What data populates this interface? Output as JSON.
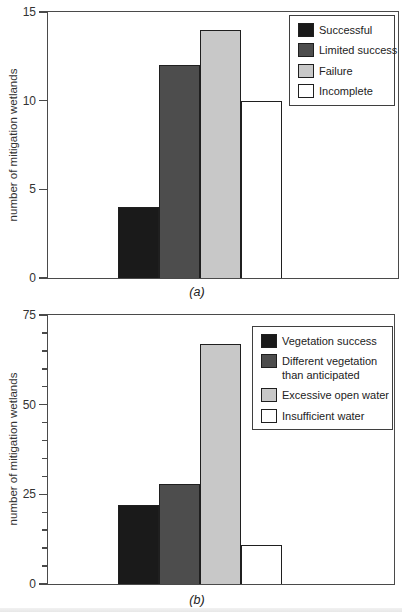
{
  "chart_data": [
    {
      "type": "bar",
      "panel": "(a)",
      "ylabel": "number of mitigation wetlands",
      "xlabel": "",
      "title": "",
      "ylim": [
        0,
        15
      ],
      "yticks": [
        0,
        5,
        10,
        15
      ],
      "minor_tick_step": null,
      "grid": false,
      "legend_position": "top-right",
      "categories": [
        "Successful",
        "Limited success",
        "Failure",
        "Incomplete"
      ],
      "values": [
        4,
        12,
        14,
        10
      ],
      "colors": [
        "#1a1a1a",
        "#4d4d4d",
        "#c8c8c8",
        "#ffffff"
      ]
    },
    {
      "type": "bar",
      "panel": "(b)",
      "ylabel": "number of mitigation wetlands",
      "xlabel": "",
      "title": "",
      "ylim": [
        0,
        75
      ],
      "yticks": [
        0,
        25,
        50,
        75
      ],
      "minor_tick_step": 5,
      "grid": false,
      "legend_position": "top-right",
      "categories": [
        "Vegetation success",
        "Different vegetation than anticipated",
        "Excessive open water",
        "Insufficient water"
      ],
      "values": [
        22,
        28,
        67,
        11
      ],
      "colors": [
        "#1a1a1a",
        "#4d4d4d",
        "#c8c8c8",
        "#ffffff"
      ]
    }
  ],
  "style": {
    "axis_color": "#4a4a4a",
    "bar_border_color": "#1f1f1f",
    "background": "#ffffff"
  }
}
